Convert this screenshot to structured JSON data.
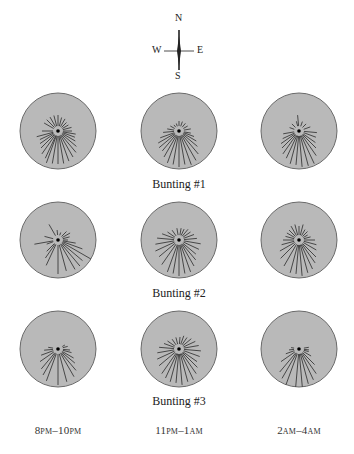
{
  "compass": {
    "n": "N",
    "s": "S",
    "e": "E",
    "w": "W"
  },
  "style": {
    "disk_fill": "#b9b9b9",
    "disk_stroke": "#6a6a6a",
    "ray_color": "#3a3a3a",
    "dot_color": "#000000"
  },
  "columns": [
    {
      "label_main": "8",
      "label_sc1": "PM",
      "label_mid": "–10",
      "label_sc2": "PM",
      "x": 58
    },
    {
      "label_main": "11",
      "label_sc1": "PM",
      "label_mid": "–1",
      "label_sc2": "AM",
      "x": 179
    },
    {
      "label_main": "2",
      "label_sc1": "AM",
      "label_mid": "–4",
      "label_sc2": "AM",
      "x": 299
    }
  ],
  "rows": [
    {
      "caption": "Bunting #1",
      "y": 131
    },
    {
      "caption": "Bunting #2",
      "y": 240
    },
    {
      "caption": "Bunting #3",
      "y": 349
    }
  ],
  "chart_data": {
    "type": "diagram",
    "grid": "3 birds × 3 time windows",
    "xlabel": [
      "8PM–10PM",
      "11PM–1AM",
      "2AM–4AM"
    ],
    "ylabel": [
      "Bunting #1",
      "Bunting #2",
      "Bunting #3"
    ],
    "compass": [
      "N",
      "E",
      "S",
      "W"
    ],
    "note": "Each disk shows hop-direction streaks radiating from center; dominant direction is southward (toward S) in all panels",
    "panels": [
      {
        "bird": "Bunting #1",
        "time": "8PM–10PM",
        "rays": [
          [
            200,
            34
          ],
          [
            190,
            33
          ],
          [
            180,
            33
          ],
          [
            170,
            33
          ],
          [
            160,
            32
          ],
          [
            150,
            30
          ],
          [
            140,
            28
          ],
          [
            130,
            24
          ],
          [
            120,
            20
          ],
          [
            110,
            18
          ],
          [
            100,
            18
          ],
          [
            90,
            14
          ],
          [
            270,
            16
          ],
          [
            255,
            22
          ],
          [
            245,
            20
          ],
          [
            235,
            22
          ],
          [
            225,
            24
          ],
          [
            215,
            28
          ],
          [
            205,
            30
          ],
          [
            300,
            16
          ],
          [
            315,
            16
          ],
          [
            330,
            16
          ],
          [
            345,
            16
          ],
          [
            0,
            16
          ],
          [
            15,
            14
          ],
          [
            30,
            14
          ],
          [
            45,
            12
          ],
          [
            60,
            12
          ],
          [
            75,
            14
          ]
        ]
      },
      {
        "bird": "Bunting #1",
        "time": "11PM–1AM",
        "rays": [
          [
            200,
            34
          ],
          [
            190,
            34
          ],
          [
            180,
            36
          ],
          [
            170,
            34
          ],
          [
            160,
            36
          ],
          [
            150,
            34
          ],
          [
            140,
            30
          ],
          [
            130,
            24
          ],
          [
            120,
            20
          ],
          [
            110,
            16
          ],
          [
            100,
            12
          ],
          [
            250,
            20
          ],
          [
            240,
            24
          ],
          [
            230,
            26
          ],
          [
            220,
            26
          ],
          [
            210,
            30
          ],
          [
            265,
            16
          ],
          [
            280,
            12
          ],
          [
            300,
            10
          ],
          [
            320,
            8
          ],
          [
            340,
            8
          ],
          [
            0,
            10
          ],
          [
            20,
            10
          ],
          [
            40,
            10
          ],
          [
            60,
            10
          ],
          [
            80,
            12
          ]
        ]
      },
      {
        "bird": "Bunting #1",
        "time": "2AM–4AM",
        "rays": [
          [
            195,
            34
          ],
          [
            185,
            34
          ],
          [
            175,
            36
          ],
          [
            165,
            36
          ],
          [
            155,
            36
          ],
          [
            145,
            30
          ],
          [
            135,
            24
          ],
          [
            125,
            20
          ],
          [
            110,
            18
          ],
          [
            95,
            18
          ],
          [
            260,
            16
          ],
          [
            245,
            18
          ],
          [
            235,
            22
          ],
          [
            225,
            24
          ],
          [
            215,
            28
          ],
          [
            205,
            30
          ],
          [
            290,
            10
          ],
          [
            315,
            10
          ],
          [
            345,
            10
          ],
          [
            355,
            16
          ],
          [
            20,
            10
          ],
          [
            45,
            10
          ],
          [
            70,
            12
          ]
        ]
      },
      {
        "bird": "Bunting #2",
        "time": "8PM–10PM",
        "rays": [
          [
            180,
            34
          ],
          [
            165,
            32
          ],
          [
            150,
            34
          ],
          [
            140,
            34
          ],
          [
            130,
            32
          ],
          [
            120,
            38
          ],
          [
            110,
            26
          ],
          [
            100,
            18
          ],
          [
            90,
            10
          ],
          [
            75,
            12
          ],
          [
            60,
            14
          ],
          [
            45,
            12
          ],
          [
            205,
            28
          ],
          [
            215,
            22
          ],
          [
            225,
            16
          ],
          [
            250,
            12
          ],
          [
            260,
            24
          ],
          [
            285,
            14
          ],
          [
            330,
            18
          ],
          [
            355,
            10
          ],
          [
            20,
            8
          ]
        ]
      },
      {
        "bird": "Bunting #2",
        "time": "11PM–1AM",
        "rays": [
          [
            200,
            34
          ],
          [
            190,
            34
          ],
          [
            180,
            36
          ],
          [
            170,
            34
          ],
          [
            160,
            34
          ],
          [
            150,
            30
          ],
          [
            140,
            26
          ],
          [
            130,
            22
          ],
          [
            115,
            22
          ],
          [
            100,
            22
          ],
          [
            85,
            18
          ],
          [
            70,
            16
          ],
          [
            55,
            14
          ],
          [
            40,
            14
          ],
          [
            25,
            12
          ],
          [
            10,
            12
          ],
          [
            350,
            12
          ],
          [
            325,
            12
          ],
          [
            305,
            14
          ],
          [
            290,
            18
          ],
          [
            275,
            22
          ],
          [
            260,
            24
          ],
          [
            245,
            26
          ],
          [
            230,
            26
          ],
          [
            215,
            30
          ]
        ]
      },
      {
        "bird": "Bunting #2",
        "time": "2AM–4AM",
        "rays": [
          [
            195,
            34
          ],
          [
            185,
            34
          ],
          [
            175,
            36
          ],
          [
            165,
            34
          ],
          [
            155,
            32
          ],
          [
            145,
            28
          ],
          [
            135,
            24
          ],
          [
            120,
            20
          ],
          [
            105,
            18
          ],
          [
            90,
            16
          ],
          [
            75,
            12
          ],
          [
            60,
            10
          ],
          [
            45,
            12
          ],
          [
            30,
            12
          ],
          [
            15,
            16
          ],
          [
            0,
            14
          ],
          [
            345,
            16
          ],
          [
            330,
            16
          ],
          [
            315,
            14
          ],
          [
            300,
            14
          ],
          [
            285,
            14
          ],
          [
            270,
            16
          ],
          [
            255,
            18
          ],
          [
            240,
            22
          ],
          [
            225,
            26
          ],
          [
            210,
            30
          ]
        ]
      },
      {
        "bird": "Bunting #3",
        "time": "8PM–10PM",
        "rays": [
          [
            180,
            36
          ],
          [
            165,
            34
          ],
          [
            150,
            32
          ],
          [
            140,
            28
          ],
          [
            130,
            22
          ],
          [
            120,
            18
          ],
          [
            105,
            14
          ],
          [
            95,
            12
          ],
          [
            200,
            34
          ],
          [
            210,
            30
          ],
          [
            220,
            26
          ],
          [
            235,
            22
          ],
          [
            250,
            18
          ],
          [
            265,
            14
          ],
          [
            280,
            10
          ],
          [
            60,
            8
          ],
          [
            75,
            10
          ]
        ]
      },
      {
        "bird": "Bunting #3",
        "time": "11PM–1AM",
        "rays": [
          [
            195,
            34
          ],
          [
            185,
            34
          ],
          [
            175,
            36
          ],
          [
            165,
            34
          ],
          [
            155,
            34
          ],
          [
            145,
            30
          ],
          [
            135,
            26
          ],
          [
            125,
            22
          ],
          [
            110,
            22
          ],
          [
            95,
            22
          ],
          [
            80,
            20
          ],
          [
            65,
            18
          ],
          [
            50,
            16
          ],
          [
            35,
            14
          ],
          [
            20,
            14
          ],
          [
            5,
            12
          ],
          [
            345,
            12
          ],
          [
            325,
            12
          ],
          [
            305,
            14
          ],
          [
            290,
            16
          ],
          [
            275,
            20
          ],
          [
            260,
            22
          ],
          [
            245,
            24
          ],
          [
            230,
            26
          ],
          [
            215,
            30
          ],
          [
            205,
            32
          ]
        ]
      },
      {
        "bird": "Bunting #3",
        "time": "2AM–4AM",
        "rays": [
          [
            185,
            38
          ],
          [
            175,
            38
          ],
          [
            165,
            36
          ],
          [
            155,
            34
          ],
          [
            145,
            30
          ],
          [
            135,
            22
          ],
          [
            120,
            14
          ],
          [
            105,
            10
          ],
          [
            200,
            38
          ],
          [
            210,
            34
          ],
          [
            220,
            30
          ],
          [
            235,
            22
          ],
          [
            250,
            14
          ],
          [
            265,
            10
          ],
          [
            280,
            8
          ],
          [
            80,
            10
          ],
          [
            95,
            10
          ]
        ]
      }
    ]
  }
}
